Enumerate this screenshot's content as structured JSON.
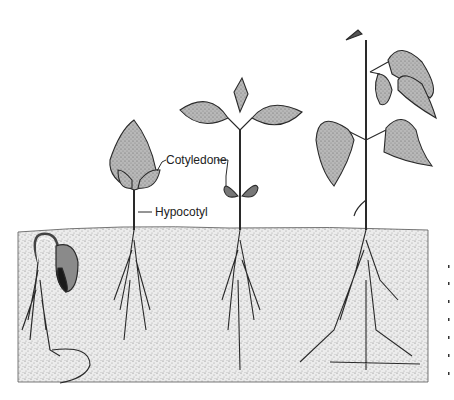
{
  "diagram": {
    "stages": [
      {
        "id": "stage-1",
        "description": "Germinating seed with hooked hypocotyl emerging from soil"
      },
      {
        "id": "stage-2",
        "description": "Seedling with cotyledons and first leaves unfolding"
      },
      {
        "id": "stage-3",
        "description": "Seedling with open primary leaves and cotyledons"
      },
      {
        "id": "stage-4",
        "description": "Young plant with trifoliate leaves"
      }
    ],
    "labels": {
      "cotyledon": "Cotyledone",
      "hypocotyl": "Hypocotyl"
    },
    "colors": {
      "ink": "#2a2a2a",
      "leaf_fill": "#9a9a9a",
      "soil_fill": "#e4e4e4",
      "background": "#ffffff"
    }
  }
}
